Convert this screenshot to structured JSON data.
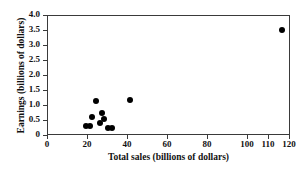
{
  "chart_data": {
    "type": "scatter",
    "title": "",
    "xlabel": "Total sales (billions of dollars)",
    "ylabel": "Earnings (billions of dollars)",
    "xlim": [
      0,
      120
    ],
    "ylim": [
      0,
      4.0
    ],
    "grid": false,
    "legend": null,
    "xticks": [
      {
        "value": 0,
        "label": "0",
        "px": 47
      },
      {
        "value": 20,
        "label": "20",
        "px": 87
      },
      {
        "value": 40,
        "label": "40",
        "px": 127
      },
      {
        "value": 60,
        "label": "60",
        "px": 167
      },
      {
        "value": 80,
        "label": "80",
        "px": 207
      },
      {
        "value": 100,
        "label": "100",
        "px": 247
      },
      {
        "value": 110,
        "label": "110",
        "px": 268
      },
      {
        "value": 120,
        "label": "120",
        "px": 289
      }
    ],
    "yticks": [
      {
        "value": 0,
        "label": "0",
        "px": 135
      },
      {
        "value": 0.5,
        "label": "0.5",
        "px": 120
      },
      {
        "value": 1.0,
        "label": "1.0",
        "px": 105
      },
      {
        "value": 1.5,
        "label": "1.5",
        "px": 90
      },
      {
        "value": 2.0,
        "label": "2.0",
        "px": 75
      },
      {
        "value": 2.5,
        "label": "2.5",
        "px": 60
      },
      {
        "value": 3.0,
        "label": "3.0",
        "px": 45
      },
      {
        "value": 3.5,
        "label": "3.5",
        "px": 30
      },
      {
        "value": 4.0,
        "label": "4.0",
        "px": 15
      }
    ],
    "points": [
      {
        "x": 19,
        "y": 0.33
      },
      {
        "x": 21,
        "y": 0.33
      },
      {
        "x": 22,
        "y": 0.63
      },
      {
        "x": 24,
        "y": 1.17
      },
      {
        "x": 26,
        "y": 0.45
      },
      {
        "x": 27,
        "y": 0.78
      },
      {
        "x": 28,
        "y": 0.57
      },
      {
        "x": 30,
        "y": 0.27
      },
      {
        "x": 32,
        "y": 0.27
      },
      {
        "x": 41,
        "y": 1.2
      },
      {
        "x": 116,
        "y": 3.55
      }
    ],
    "marker": {
      "shape": "circle",
      "color": "#000000",
      "size": 6
    },
    "axis_color": "#3a3a3a",
    "background": "#ffffff"
  }
}
